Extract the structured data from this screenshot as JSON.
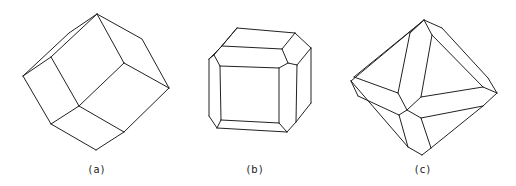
{
  "figures": [
    {
      "id": "a",
      "label": "(a)",
      "label_pos": [
        97,
        164
      ],
      "description": "Rhombic dodecahedron",
      "edges": [
        [
          [
            97,
            14
          ],
          [
            69,
            33
          ],
          [
            23,
            76
          ]
        ],
        [
          [
            97,
            14
          ],
          [
            51,
            57
          ],
          [
            23,
            76
          ]
        ],
        [
          [
            97,
            14
          ],
          [
            142,
            39
          ],
          [
            169,
            88
          ]
        ],
        [
          [
            97,
            14
          ],
          [
            124,
            63
          ]
        ],
        [
          [
            51,
            57
          ],
          [
            79,
            106
          ]
        ],
        [
          [
            124,
            63
          ],
          [
            169,
            88
          ]
        ],
        [
          [
            124,
            63
          ],
          [
            79,
            106
          ]
        ],
        [
          [
            23,
            76
          ],
          [
            51,
            124
          ]
        ],
        [
          [
            79,
            106
          ],
          [
            51,
            124
          ]
        ],
        [
          [
            79,
            106
          ],
          [
            124,
            132
          ]
        ],
        [
          [
            169,
            88
          ],
          [
            124,
            132
          ]
        ],
        [
          [
            51,
            124
          ],
          [
            96,
            150
          ]
        ],
        [
          [
            124,
            132
          ],
          [
            96,
            150
          ]
        ]
      ]
    },
    {
      "id": "b",
      "label": "(b)",
      "label_pos": [
        255,
        164
      ],
      "description": "Truncated cube with beveled edges",
      "edges": [
        [
          [
            237,
            28
          ],
          [
            295,
            33
          ]
        ],
        [
          [
            237,
            28
          ],
          [
            222,
            46
          ]
        ],
        [
          [
            237,
            28
          ],
          [
            214,
            55
          ]
        ],
        [
          [
            295,
            33
          ],
          [
            282,
            49
          ]
        ],
        [
          [
            295,
            33
          ],
          [
            311,
            48
          ]
        ],
        [
          [
            222,
            46
          ],
          [
            282,
            49
          ]
        ],
        [
          [
            222,
            46
          ],
          [
            209,
            59
          ]
        ],
        [
          [
            214,
            55
          ],
          [
            209,
            59
          ]
        ],
        [
          [
            214,
            55
          ],
          [
            220,
            66
          ]
        ],
        [
          [
            282,
            49
          ],
          [
            288,
            63
          ]
        ],
        [
          [
            311,
            48
          ],
          [
            297,
            65
          ]
        ],
        [
          [
            288,
            63
          ],
          [
            297,
            65
          ]
        ],
        [
          [
            220,
            66
          ],
          [
            279,
            68
          ]
        ],
        [
          [
            279,
            68
          ],
          [
            288,
            63
          ]
        ],
        [
          [
            220,
            66
          ],
          [
            221,
            120
          ]
        ],
        [
          [
            279,
            68
          ],
          [
            279,
            123
          ]
        ],
        [
          [
            221,
            120
          ],
          [
            279,
            123
          ]
        ],
        [
          [
            209,
            59
          ],
          [
            209,
            116
          ]
        ],
        [
          [
            297,
            65
          ],
          [
            296,
            122
          ]
        ],
        [
          [
            311,
            48
          ],
          [
            311,
            103
          ]
        ],
        [
          [
            209,
            116
          ],
          [
            217,
            128
          ]
        ],
        [
          [
            221,
            120
          ],
          [
            217,
            128
          ]
        ],
        [
          [
            217,
            128
          ],
          [
            287,
            132
          ]
        ],
        [
          [
            279,
            123
          ],
          [
            287,
            132
          ]
        ],
        [
          [
            287,
            132
          ],
          [
            296,
            122
          ]
        ],
        [
          [
            296,
            122
          ],
          [
            311,
            103
          ]
        ]
      ]
    },
    {
      "id": "c",
      "label": "(c)",
      "label_pos": [
        423,
        164
      ],
      "description": "Octahedron with truncated edges",
      "edges": [
        [
          [
            424,
            20
          ],
          [
            354,
            77
          ]
        ],
        [
          [
            424,
            20
          ],
          [
            351,
            81
          ]
        ],
        [
          [
            424,
            20
          ],
          [
            410,
            33
          ]
        ],
        [
          [
            424,
            20
          ],
          [
            432,
            35
          ]
        ],
        [
          [
            424,
            20
          ],
          [
            442,
            28
          ]
        ],
        [
          [
            442,
            28
          ],
          [
            488,
            78
          ]
        ],
        [
          [
            432,
            35
          ],
          [
            483,
            87
          ]
        ],
        [
          [
            488,
            78
          ],
          [
            497,
            93
          ]
        ],
        [
          [
            483,
            87
          ],
          [
            497,
            93
          ]
        ],
        [
          [
            410,
            33
          ],
          [
            398,
            93
          ]
        ],
        [
          [
            432,
            35
          ],
          [
            421,
            97
          ]
        ],
        [
          [
            354,
            77
          ],
          [
            398,
            93
          ]
        ],
        [
          [
            351,
            81
          ],
          [
            358,
            96
          ]
        ],
        [
          [
            398,
            93
          ],
          [
            407,
            110
          ]
        ],
        [
          [
            421,
            97
          ],
          [
            407,
            110
          ]
        ],
        [
          [
            421,
            97
          ],
          [
            483,
            87
          ]
        ],
        [
          [
            358,
            96
          ],
          [
            399,
            115
          ]
        ],
        [
          [
            407,
            110
          ],
          [
            399,
            115
          ]
        ],
        [
          [
            407,
            110
          ],
          [
            421,
            118
          ]
        ],
        [
          [
            421,
            118
          ],
          [
            483,
            106
          ]
        ],
        [
          [
            497,
            93
          ],
          [
            483,
            106
          ]
        ],
        [
          [
            399,
            115
          ],
          [
            408,
            147
          ]
        ],
        [
          [
            421,
            118
          ],
          [
            431,
            148
          ]
        ],
        [
          [
            351,
            81
          ],
          [
            408,
            147
          ]
        ],
        [
          [
            408,
            147
          ],
          [
            422,
            155
          ]
        ],
        [
          [
            431,
            148
          ],
          [
            422,
            155
          ]
        ],
        [
          [
            483,
            106
          ],
          [
            431,
            148
          ]
        ]
      ]
    }
  ]
}
